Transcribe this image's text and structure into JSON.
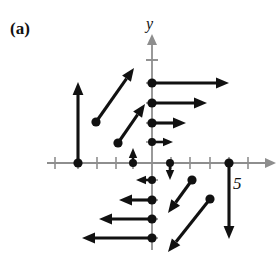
{
  "figure": {
    "panel_label": "(a)",
    "axis_y_label": "y",
    "x_tick_label": "5",
    "colors": {
      "vector": "#111111",
      "axis": "#8e8e8e",
      "background": "#ffffff",
      "text": "#111111"
    }
  },
  "chart_data": {
    "type": "scatter",
    "title": "(a)",
    "xlabel": "",
    "ylabel": "y",
    "grid": false,
    "legend": null,
    "axis": {
      "origin_px": [
        152,
        163
      ],
      "tick_spacing_px": 19,
      "x_tick_labels": [
        "5"
      ],
      "x_tick_label_values": [
        5
      ],
      "y_tick_labels": [],
      "xlim": [
        -5.6,
        6.6
      ],
      "ylim": [
        -4.8,
        6.8
      ]
    },
    "vectors": [
      {
        "name": "up-arrow-left",
        "tail_px": [
          78,
          163
        ],
        "head_px": [
          78,
          82
        ],
        "dot_at": "tail",
        "style": "thick"
      },
      {
        "name": "diagonal-up-right-1",
        "tail_px": [
          96,
          122
        ],
        "head_px": [
          134,
          68
        ],
        "dot_at": "tail",
        "style": "thick"
      },
      {
        "name": "diagonal-up-right-2",
        "tail_px": [
          118,
          143
        ],
        "head_px": [
          145,
          104
        ],
        "dot_at": "tail",
        "style": "thick"
      },
      {
        "name": "short-up-arrow",
        "tail_px": [
          133,
          163
        ],
        "head_px": [
          133,
          148
        ],
        "dot_at": "tail",
        "style": "thin"
      },
      {
        "name": "right-arrow-1",
        "tail_px": [
          152,
          83
        ],
        "head_px": [
          229,
          83
        ],
        "dot_at": "tail",
        "style": "thick"
      },
      {
        "name": "right-arrow-2",
        "tail_px": [
          152,
          103
        ],
        "head_px": [
          207,
          103
        ],
        "dot_at": "tail",
        "style": "thick"
      },
      {
        "name": "right-arrow-3",
        "tail_px": [
          152,
          123
        ],
        "head_px": [
          186,
          123
        ],
        "dot_at": "tail",
        "style": "thick"
      },
      {
        "name": "right-arrow-4",
        "tail_px": [
          152,
          142
        ],
        "head_px": [
          173,
          142
        ],
        "dot_at": "tail",
        "style": "thin"
      },
      {
        "name": "short-down-arrow",
        "tail_px": [
          170,
          163
        ],
        "head_px": [
          170,
          180
        ],
        "dot_at": "tail",
        "style": "thin"
      },
      {
        "name": "left-arrow-1",
        "tail_px": [
          152,
          180
        ],
        "head_px": [
          136,
          180
        ],
        "dot_at": "tail",
        "style": "thin"
      },
      {
        "name": "left-arrow-2",
        "tail_px": [
          152,
          200
        ],
        "head_px": [
          119,
          200
        ],
        "dot_at": "tail",
        "style": "thick"
      },
      {
        "name": "left-arrow-3",
        "tail_px": [
          152,
          219
        ],
        "head_px": [
          99,
          219
        ],
        "dot_at": "tail",
        "style": "thick"
      },
      {
        "name": "left-arrow-4",
        "tail_px": [
          152,
          238
        ],
        "head_px": [
          82,
          238
        ],
        "dot_at": "tail",
        "style": "thick"
      },
      {
        "name": "diagonal-down-left-1",
        "tail_px": [
          192,
          180
        ],
        "head_px": [
          168,
          213
        ],
        "dot_at": "tail",
        "style": "thick"
      },
      {
        "name": "diagonal-down-left-2",
        "tail_px": [
          210,
          199
        ],
        "head_px": [
          168,
          252
        ],
        "dot_at": "tail",
        "style": "thick"
      },
      {
        "name": "down-arrow-right",
        "tail_px": [
          229,
          163
        ],
        "head_px": [
          229,
          239
        ],
        "dot_at": "tail",
        "style": "thick"
      }
    ],
    "x_axis_ticks_px": [
      55,
      78,
      97,
      116,
      133,
      171,
      190,
      210,
      229,
      248
    ],
    "y_axis_ticks_px": [
      60,
      83,
      103,
      123,
      142,
      180,
      200,
      219,
      238
    ]
  }
}
